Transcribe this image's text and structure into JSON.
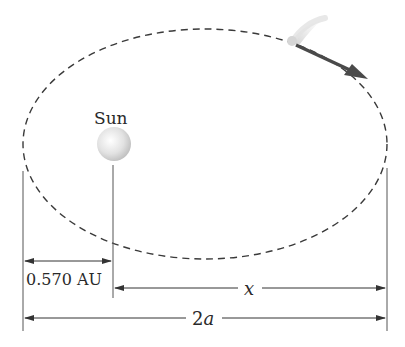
{
  "diagram": {
    "labels": {
      "sun": "Sun",
      "perihelion_distance": "0.570 AU",
      "x_distance": "x",
      "major_axis_num": "2",
      "major_axis_var": "a"
    },
    "elements": [
      "dashed-elliptical-orbit",
      "sun-sphere",
      "comet-with-tail",
      "velocity-arrow",
      "dimension-lines"
    ],
    "colors": {
      "orbit": "#3a3a3a",
      "arrow": "#4a4a4a",
      "sun": "#d8d8d8",
      "lines": "#555555"
    }
  }
}
